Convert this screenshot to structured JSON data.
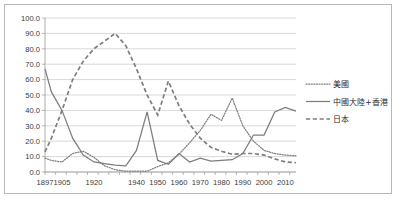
{
  "chart_data": {
    "type": "line",
    "title": "",
    "subtitle": "",
    "xlabel": "",
    "ylabel": "",
    "ylim": [
      0,
      100
    ],
    "ytick_labels": [
      "0.0",
      "10.0",
      "20.0",
      "30.0",
      "40.0",
      "50.0",
      "60.0",
      "70.0",
      "80.0",
      "90.0",
      "100.0"
    ],
    "ytick_values": [
      0,
      10,
      20,
      30,
      40,
      50,
      60,
      70,
      80,
      90,
      100
    ],
    "xtick_labels": [
      "1897",
      "1905",
      "1920",
      "1940",
      "1950",
      "1960",
      "1970",
      "1980",
      "1990",
      "2000",
      "2010"
    ],
    "xtick_values": [
      1897,
      1905,
      1920,
      1940,
      1950,
      1960,
      1970,
      1980,
      1990,
      2000,
      2010
    ],
    "xlim": [
      1897,
      2015
    ],
    "grid": "horizontal",
    "legend_position": "right",
    "x": [
      1897,
      1900,
      1905,
      1910,
      1915,
      1920,
      1925,
      1930,
      1935,
      1940,
      1945,
      1950,
      1955,
      1960,
      1965,
      1970,
      1975,
      1980,
      1985,
      1990,
      1995,
      2000,
      2005,
      2010,
      2015
    ],
    "series": [
      {
        "name": "美國",
        "style": "dotted",
        "color": "#7d7d7d",
        "values": [
          9.0,
          7.5,
          6.5,
          12.0,
          13.5,
          9.5,
          4.0,
          1.5,
          0.5,
          0.5,
          0.5,
          3.5,
          6.0,
          11.5,
          19.0,
          27.0,
          37.5,
          33.5,
          48.0,
          30.0,
          20.0,
          14.0,
          12.0,
          11.0,
          10.5
        ]
      },
      {
        "name": "中國大陸+香港",
        "style": "solid",
        "color": "#7d7d7d",
        "values": [
          67.0,
          52.0,
          40.0,
          22.0,
          11.0,
          6.5,
          5.5,
          4.5,
          4.0,
          14.0,
          39.0,
          7.5,
          5.0,
          12.0,
          6.5,
          9.0,
          7.0,
          7.5,
          8.0,
          12.0,
          24.0,
          24.0,
          39.0,
          42.0,
          39.5
        ]
      },
      {
        "name": "日本",
        "style": "dashed",
        "color": "#7d7d7d",
        "values": [
          13.0,
          22.0,
          40.0,
          60.0,
          72.0,
          80.0,
          85.0,
          90.0,
          82.0,
          67.0,
          50.0,
          37.0,
          59.0,
          43.0,
          31.0,
          22.0,
          16.0,
          13.5,
          11.5,
          12.0,
          12.0,
          11.0,
          8.5,
          6.5,
          6.0
        ]
      }
    ]
  },
  "legend": {
    "items": [
      {
        "label": "美國",
        "style": "dotted"
      },
      {
        "label": "中國大陸+香港",
        "style": "solid"
      },
      {
        "label": "日本",
        "style": "dashed"
      }
    ]
  }
}
